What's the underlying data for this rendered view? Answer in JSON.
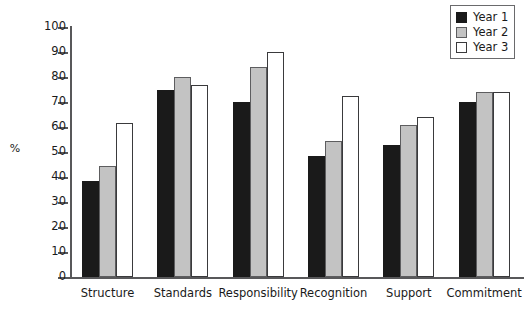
{
  "chart_data": {
    "type": "bar",
    "title": "",
    "subtitle": "",
    "xlabel": "",
    "ylabel": "%",
    "ylim": [
      0,
      100
    ],
    "yticks": [
      0,
      10,
      20,
      30,
      40,
      50,
      60,
      70,
      80,
      90,
      100
    ],
    "grid": false,
    "legend_position": "top-right",
    "categories": [
      "Structure",
      "Standards",
      "Responsibility",
      "Recognition",
      "Support",
      "Commitment"
    ],
    "series": [
      {
        "name": "Year 1",
        "color": "#1a1a1a",
        "values": [
          38.5,
          75,
          70,
          48.5,
          53,
          70
        ]
      },
      {
        "name": "Year 2",
        "color": "#c3c3c3",
        "values": [
          44.5,
          80,
          84,
          54.5,
          61,
          74
        ]
      },
      {
        "name": "Year 3",
        "color": "#ffffff",
        "values": [
          61.5,
          77,
          90,
          72.5,
          64,
          74
        ]
      }
    ]
  },
  "axis": {
    "y_title": "%"
  }
}
